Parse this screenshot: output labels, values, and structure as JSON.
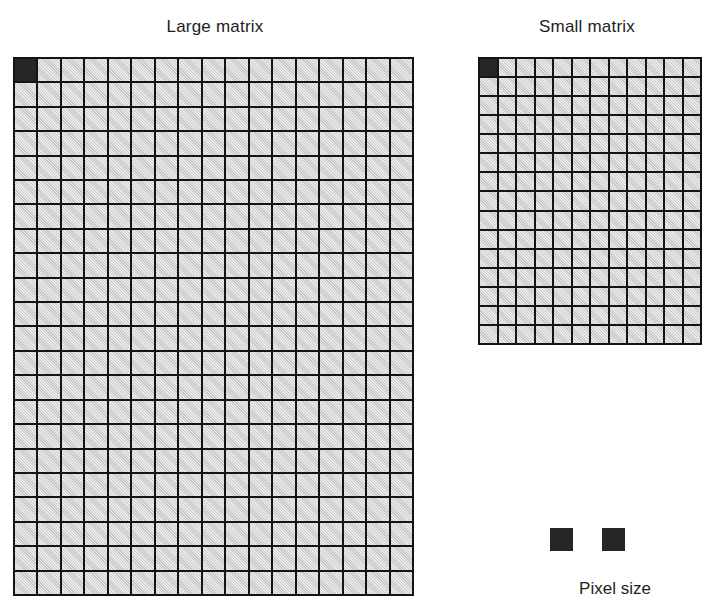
{
  "figure": {
    "panels": [
      {
        "id": "large",
        "title": "Large matrix",
        "columns": 17,
        "rows": 22,
        "cell_fill_color": "#d2d2d2",
        "grid_line_color": "#141414",
        "highlighted_cell": {
          "row": 1,
          "column": 1,
          "color": "#262626"
        }
      },
      {
        "id": "small",
        "title": "Small matrix",
        "columns": 12,
        "rows": 15,
        "cell_fill_color": "#d2d2d2",
        "grid_line_color": "#141414",
        "highlighted_cell": {
          "row": 1,
          "column": 1,
          "color": "#262626"
        }
      }
    ],
    "legend": {
      "label": "Pixel size",
      "swatches": [
        {
          "name": "large-matrix-pixel",
          "color": "#262626"
        },
        {
          "name": "small-matrix-pixel",
          "color": "#262626"
        }
      ]
    },
    "background_color": "#ffffff",
    "text_color": "#1d1d1d"
  }
}
